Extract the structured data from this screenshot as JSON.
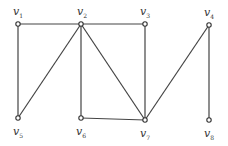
{
  "graph": {
    "nodes": [
      {
        "id": "v1",
        "label": "v",
        "sub": "1",
        "x": 18,
        "y": 24,
        "lx": 13,
        "ly": 6
      },
      {
        "id": "v2",
        "label": "v",
        "sub": "2",
        "x": 81,
        "y": 24,
        "lx": 77,
        "ly": 6
      },
      {
        "id": "v3",
        "label": "v",
        "sub": "3",
        "x": 145,
        "y": 24,
        "lx": 140,
        "ly": 6
      },
      {
        "id": "v4",
        "label": "v",
        "sub": "4",
        "x": 209,
        "y": 25,
        "lx": 204,
        "ly": 7
      },
      {
        "id": "v5",
        "label": "v",
        "sub": "5",
        "x": 18,
        "y": 118,
        "lx": 13,
        "ly": 126
      },
      {
        "id": "v6",
        "label": "v",
        "sub": "6",
        "x": 81,
        "y": 118,
        "lx": 76,
        "ly": 126
      },
      {
        "id": "v7",
        "label": "v",
        "sub": "7",
        "x": 145,
        "y": 120,
        "lx": 140,
        "ly": 128
      },
      {
        "id": "v8",
        "label": "v",
        "sub": "8",
        "x": 209,
        "y": 120,
        "lx": 204,
        "ly": 128
      }
    ],
    "edges": [
      [
        "v1",
        "v2"
      ],
      [
        "v2",
        "v3"
      ],
      [
        "v1",
        "v5"
      ],
      [
        "v2",
        "v5"
      ],
      [
        "v2",
        "v6"
      ],
      [
        "v2",
        "v7"
      ],
      [
        "v3",
        "v7"
      ],
      [
        "v6",
        "v7"
      ],
      [
        "v4",
        "v7"
      ],
      [
        "v4",
        "v8"
      ]
    ],
    "colors": {
      "edge": "#444444",
      "node_fill": "#ffffff",
      "node_stroke": "#333333"
    }
  }
}
